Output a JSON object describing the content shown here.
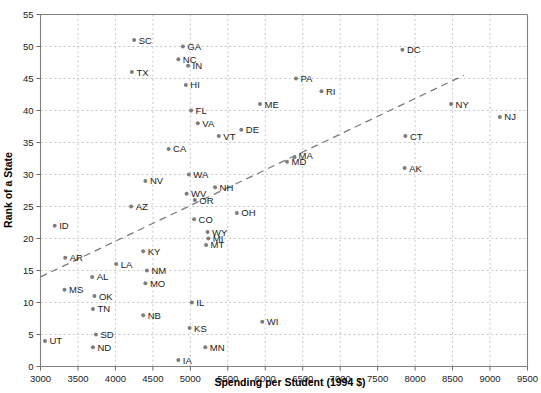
{
  "chart_data": {
    "type": "scatter",
    "title": "",
    "xlabel": "Spending per Student (1994 $)",
    "ylabel": "Rank of a State",
    "xlim": [
      3000,
      9500
    ],
    "ylim": [
      0,
      55
    ],
    "xticks": [
      3000,
      3500,
      4000,
      4500,
      5000,
      5500,
      6000,
      6500,
      7000,
      7500,
      8000,
      8500,
      9000,
      9500
    ],
    "yticks": [
      0,
      5,
      10,
      15,
      20,
      25,
      30,
      35,
      40,
      45,
      50,
      55
    ],
    "grid": true,
    "legend": "none",
    "marker": "dot",
    "marker_color": "#7d7d7d",
    "trendline": {
      "style": "dashed",
      "color": "#7a7a7a",
      "x0": 3000,
      "y0": 14.0,
      "x1": 8650,
      "y1": 45.5
    },
    "point_label_key": "state",
    "points": [
      {
        "state": "UT",
        "x": 3060,
        "y": 4,
        "lx": 10,
        "ly": 3.5
      },
      {
        "state": "ID",
        "x": 3190,
        "y": 22,
        "lx": 10,
        "ly": 3.5
      },
      {
        "state": "AR",
        "x": 3330,
        "y": 17,
        "lx": 10,
        "ly": 3.5
      },
      {
        "state": "MS",
        "x": 3320,
        "y": 12,
        "lx": 10,
        "ly": 3.5
      },
      {
        "state": "SC",
        "x": 4250,
        "y": 51,
        "lx": 10,
        "ly": 3.5
      },
      {
        "state": "TX",
        "x": 4220,
        "y": 46,
        "lx": 10,
        "ly": 3.5
      },
      {
        "state": "AL",
        "x": 3690,
        "y": 14,
        "lx": 10,
        "ly": 3.5
      },
      {
        "state": "OK",
        "x": 3720,
        "y": 11,
        "lx": 10,
        "ly": 3.5
      },
      {
        "state": "TN",
        "x": 3700,
        "y": 9,
        "lx": 10,
        "ly": 3.5
      },
      {
        "state": "SD",
        "x": 3740,
        "y": 5,
        "lx": 10,
        "ly": 3.5
      },
      {
        "state": "ND",
        "x": 3700,
        "y": 3,
        "lx": 10,
        "ly": 3.5
      },
      {
        "state": "LA",
        "x": 4010,
        "y": 16,
        "lx": 10,
        "ly": 3.5
      },
      {
        "state": "AZ",
        "x": 4210,
        "y": 25,
        "lx": 10,
        "ly": 3.5
      },
      {
        "state": "KY",
        "x": 4370,
        "y": 18,
        "lx": 10,
        "ly": 3.5
      },
      {
        "state": "NM",
        "x": 4420,
        "y": 15,
        "lx": 10,
        "ly": 3.5
      },
      {
        "state": "MO",
        "x": 4400,
        "y": 13,
        "lx": 10,
        "ly": 3.5
      },
      {
        "state": "NB",
        "x": 4370,
        "y": 8,
        "lx": 10,
        "ly": 3.5
      },
      {
        "state": "NV",
        "x": 4400,
        "y": 29,
        "lx": 10,
        "ly": 3.5
      },
      {
        "state": "CA",
        "x": 4710,
        "y": 34,
        "lx": 10,
        "ly": 3.5
      },
      {
        "state": "GA",
        "x": 4900,
        "y": 50,
        "lx": 10,
        "ly": 3.5
      },
      {
        "state": "NC",
        "x": 4840,
        "y": 48,
        "lx": 10,
        "ly": 3.5
      },
      {
        "state": "IN",
        "x": 4970,
        "y": 47,
        "lx": 10,
        "ly": 3.5
      },
      {
        "state": "HI",
        "x": 4940,
        "y": 44,
        "lx": 10,
        "ly": 3.5
      },
      {
        "state": "FL",
        "x": 5010,
        "y": 40,
        "lx": 10,
        "ly": 3.5
      },
      {
        "state": "WA",
        "x": 4980,
        "y": 30,
        "lx": 10,
        "ly": 3.5
      },
      {
        "state": "WV",
        "x": 4950,
        "y": 27,
        "lx": 10,
        "ly": 3.5
      },
      {
        "state": "OR",
        "x": 5060,
        "y": 26,
        "lx": 10,
        "ly": 3.5
      },
      {
        "state": "CO",
        "x": 5050,
        "y": 23,
        "lx": 10,
        "ly": 3.5
      },
      {
        "state": "IL",
        "x": 5020,
        "y": 10,
        "lx": 10,
        "ly": 3.5
      },
      {
        "state": "KS",
        "x": 4990,
        "y": 6,
        "lx": 10,
        "ly": 3.5
      },
      {
        "state": "IA",
        "x": 4840,
        "y": 1,
        "lx": 10,
        "ly": 3.5
      },
      {
        "state": "VA",
        "x": 5100,
        "y": 38,
        "lx": 10,
        "ly": 3.5
      },
      {
        "state": "VT",
        "x": 5380,
        "y": 36,
        "lx": 10,
        "ly": 3.5
      },
      {
        "state": "DE",
        "x": 5680,
        "y": 37,
        "lx": 10,
        "ly": 3.5
      },
      {
        "state": "NH",
        "x": 5330,
        "y": 28,
        "lx": 10,
        "ly": 3.5
      },
      {
        "state": "WY",
        "x": 5230,
        "y": 21,
        "lx": 10,
        "ly": 3.5
      },
      {
        "state": "MI",
        "x": 5240,
        "y": 20,
        "lx": 10,
        "ly": 3.5
      },
      {
        "state": "MT",
        "x": 5210,
        "y": 19,
        "lx": 10,
        "ly": 3.5
      },
      {
        "state": "OH",
        "x": 5620,
        "y": 24,
        "lx": 10,
        "ly": 3.5
      },
      {
        "state": "MN",
        "x": 5200,
        "y": 3,
        "lx": 10,
        "ly": 3.5
      },
      {
        "state": "WI",
        "x": 5960,
        "y": 7,
        "lx": 10,
        "ly": 3.5
      },
      {
        "state": "ME",
        "x": 5930,
        "y": 41,
        "lx": 10,
        "ly": 3.5
      },
      {
        "state": "MD",
        "x": 6290,
        "y": 32,
        "lx": 10,
        "ly": 3.5
      },
      {
        "state": "MA",
        "x": 6390,
        "y": 32.7,
        "lx": 9,
        "ly": 2.0
      },
      {
        "state": "PA",
        "x": 6410,
        "y": 45,
        "lx": 10,
        "ly": 3.5
      },
      {
        "state": "RI",
        "x": 6750,
        "y": 43,
        "lx": 10,
        "ly": 3.5
      },
      {
        "state": "DC",
        "x": 7830,
        "y": 49.5,
        "lx": 10,
        "ly": 3.5
      },
      {
        "state": "CT",
        "x": 7870,
        "y": 36,
        "lx": 10,
        "ly": 3.5
      },
      {
        "state": "AK",
        "x": 7860,
        "y": 31,
        "lx": 10,
        "ly": 3.5
      },
      {
        "state": "NY",
        "x": 8480,
        "y": 41,
        "lx": 10,
        "ly": 3.5
      },
      {
        "state": "NJ",
        "x": 9130,
        "y": 39,
        "lx": 10,
        "ly": 3.5
      }
    ]
  }
}
